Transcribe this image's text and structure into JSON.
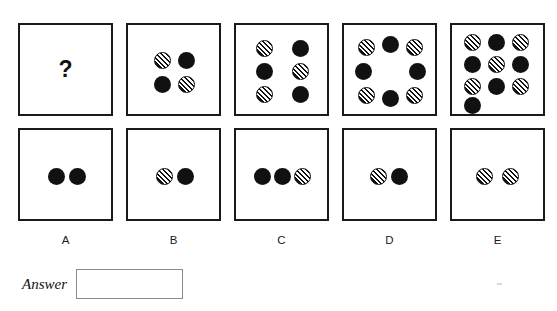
{
  "puzzle": {
    "type": "visual-analogy-matrix",
    "question_mark": "?",
    "dot_styles": {
      "solid": "solid-black-circle",
      "hatched": "diagonal-striped-circle"
    },
    "colors": {
      "dot_fill": "#111111",
      "panel_border": "#1a1a1a",
      "background": "#ffffff",
      "answer_box_border": "#8a8a8a"
    },
    "panel_size": {
      "width": 95,
      "height": 93
    },
    "dot_diameter": 17,
    "top_row": [
      {
        "id": "top-a",
        "label": "A",
        "is_question": true,
        "dot_count": 0,
        "dots": []
      },
      {
        "id": "top-b",
        "label": "B",
        "is_question": false,
        "dot_count": 4,
        "dots": [
          {
            "style": "hatched",
            "x": 26,
            "y": 27
          },
          {
            "style": "solid",
            "x": 50,
            "y": 27
          },
          {
            "style": "solid",
            "x": 26,
            "y": 51
          },
          {
            "style": "hatched",
            "x": 50,
            "y": 51
          }
        ]
      },
      {
        "id": "top-c",
        "label": "C",
        "is_question": false,
        "dot_count": 6,
        "dots": [
          {
            "style": "hatched",
            "x": 20,
            "y": 15
          },
          {
            "style": "solid",
            "x": 56,
            "y": 15
          },
          {
            "style": "solid",
            "x": 20,
            "y": 38
          },
          {
            "style": "hatched",
            "x": 56,
            "y": 38
          },
          {
            "style": "hatched",
            "x": 20,
            "y": 61
          },
          {
            "style": "solid",
            "x": 56,
            "y": 61
          }
        ]
      },
      {
        "id": "top-d",
        "label": "D",
        "is_question": false,
        "dot_count": 8,
        "dots": [
          {
            "style": "hatched",
            "x": 14,
            "y": 14
          },
          {
            "style": "solid",
            "x": 38,
            "y": 11
          },
          {
            "style": "hatched",
            "x": 62,
            "y": 14
          },
          {
            "style": "solid",
            "x": 11,
            "y": 38
          },
          {
            "style": "solid",
            "x": 65,
            "y": 38
          },
          {
            "style": "hatched",
            "x": 14,
            "y": 62
          },
          {
            "style": "solid",
            "x": 38,
            "y": 65
          },
          {
            "style": "hatched",
            "x": 62,
            "y": 62
          }
        ]
      },
      {
        "id": "top-e",
        "label": "E",
        "is_question": false,
        "dot_count": 10,
        "dots": [
          {
            "style": "hatched",
            "x": 12,
            "y": 9
          },
          {
            "style": "solid",
            "x": 36,
            "y": 9
          },
          {
            "style": "hatched",
            "x": 60,
            "y": 9
          },
          {
            "style": "solid",
            "x": 12,
            "y": 31
          },
          {
            "style": "hatched",
            "x": 36,
            "y": 31
          },
          {
            "style": "solid",
            "x": 60,
            "y": 31
          },
          {
            "style": "hatched",
            "x": 12,
            "y": 53
          },
          {
            "style": "solid",
            "x": 36,
            "y": 53
          },
          {
            "style": "hatched",
            "x": 60,
            "y": 53
          },
          {
            "style": "solid",
            "x": 12,
            "y": 72
          }
        ]
      }
    ],
    "bottom_row": [
      {
        "id": "bottom-a",
        "label": "A",
        "dot_count": 2,
        "dots": [
          {
            "style": "solid",
            "x": 28,
            "y": 38
          },
          {
            "style": "solid",
            "x": 49,
            "y": 38
          }
        ]
      },
      {
        "id": "bottom-b",
        "label": "B",
        "dot_count": 2,
        "dots": [
          {
            "style": "hatched",
            "x": 28,
            "y": 38
          },
          {
            "style": "solid",
            "x": 49,
            "y": 38
          }
        ]
      },
      {
        "id": "bottom-c",
        "label": "C",
        "dot_count": 3,
        "dots": [
          {
            "style": "solid",
            "x": 18,
            "y": 38
          },
          {
            "style": "solid",
            "x": 38,
            "y": 38
          },
          {
            "style": "hatched",
            "x": 58,
            "y": 38
          }
        ]
      },
      {
        "id": "bottom-d",
        "label": "D",
        "dot_count": 2,
        "dots": [
          {
            "style": "hatched",
            "x": 26,
            "y": 38
          },
          {
            "style": "solid",
            "x": 47,
            "y": 38
          }
        ]
      },
      {
        "id": "bottom-e",
        "label": "E",
        "dot_count": 2,
        "dots": [
          {
            "style": "hatched",
            "x": 24,
            "y": 38
          },
          {
            "style": "hatched",
            "x": 50,
            "y": 38
          }
        ]
      }
    ],
    "option_labels": [
      "A",
      "B",
      "C",
      "D",
      "E"
    ],
    "answer": {
      "label": "Answer",
      "value": "",
      "placeholder": ""
    }
  }
}
